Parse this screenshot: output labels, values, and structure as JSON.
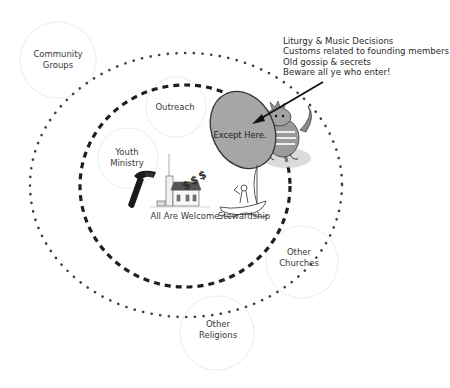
{
  "diagram": {
    "rings": {
      "outer": {
        "style": "dotted",
        "color": "#3d3d3d"
      },
      "inner": {
        "style": "dashed",
        "color": "#222222"
      }
    },
    "circles": [
      {
        "id": "community-groups",
        "lines": [
          "Community",
          "Groups"
        ]
      },
      {
        "id": "outreach",
        "lines": [
          "Outreach"
        ]
      },
      {
        "id": "youth-ministry",
        "lines": [
          "Youth",
          "Ministry"
        ]
      },
      {
        "id": "other-churches",
        "lines": [
          "Other",
          "Churches"
        ]
      },
      {
        "id": "other-religions",
        "lines": [
          "Other",
          "Religions"
        ]
      }
    ],
    "center_labels": {
      "church": "All Are Welcome",
      "boat": "Stewardship"
    },
    "core": {
      "label": "Except Here.",
      "fill": "#a6a6a6"
    },
    "note": {
      "lines": [
        "Liturgy & Music Decisions",
        "Customs related to founding members",
        "Old gossip & secrets",
        "Beware all ye who enter!"
      ]
    },
    "icons": [
      "hammer-icon",
      "church-icon",
      "dollar-signs-icon",
      "sailboat-icon",
      "dragon-icon",
      "arrow-icon"
    ]
  }
}
